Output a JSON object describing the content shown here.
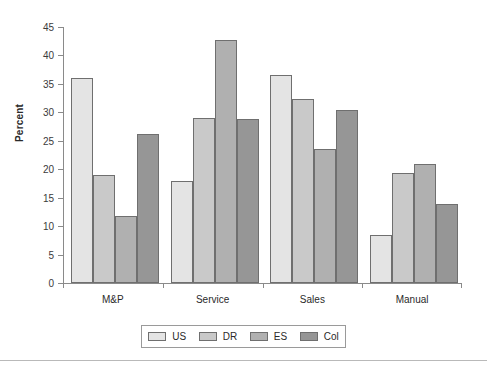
{
  "chart_data": {
    "type": "bar",
    "title": "",
    "subtitle": "",
    "xlabel": "",
    "ylabel": "Percent",
    "categories": [
      "M&P",
      "Service",
      "Sales",
      "Manual"
    ],
    "series": [
      {
        "name": "US",
        "color": "#e4e4e4",
        "values": [
          36.1,
          18.0,
          36.5,
          8.5
        ]
      },
      {
        "name": "DR",
        "color": "#c9c9c9",
        "values": [
          19.0,
          29.0,
          32.3,
          19.3
        ]
      },
      {
        "name": "ES",
        "color": "#b0b0b0",
        "values": [
          11.7,
          42.7,
          23.5,
          20.9
        ]
      },
      {
        "name": "Col",
        "color": "#969696",
        "values": [
          26.2,
          28.8,
          30.4,
          13.9
        ]
      }
    ],
    "ylim": [
      0,
      45
    ],
    "ytick_step": 5,
    "yticks": [
      45,
      40,
      35,
      30,
      25,
      20,
      15,
      10,
      5,
      0
    ],
    "grid": false,
    "legend_position": "bottom",
    "bar_border_color": "#6f6f6f",
    "axis_color": "#8a8a8a"
  },
  "legend": {
    "items": [
      {
        "label": "US",
        "color": "#e4e4e4"
      },
      {
        "label": "DR",
        "color": "#c9c9c9"
      },
      {
        "label": "ES",
        "color": "#b0b0b0"
      },
      {
        "label": "Col",
        "color": "#969696"
      }
    ]
  }
}
